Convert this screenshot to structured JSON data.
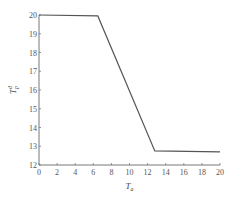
{
  "chart_data": {
    "type": "line",
    "title": "",
    "xlabel": "T_a",
    "ylabel": "T_p^d",
    "xlabel_parts": {
      "main": "T",
      "sub": "a"
    },
    "ylabel_parts": {
      "main": "T",
      "sub": "p",
      "sup": "d"
    },
    "xlim": [
      0,
      20
    ],
    "ylim": [
      12,
      20
    ],
    "xticks": [
      0,
      2,
      4,
      6,
      8,
      10,
      12,
      14,
      16,
      18,
      20
    ],
    "yticks": [
      12,
      13,
      14,
      15,
      16,
      17,
      18,
      19,
      20
    ],
    "grid": false,
    "legend": null,
    "series": [
      {
        "name": "T_p^d",
        "color": "#555555",
        "x": [
          0,
          6.5,
          12.8,
          20
        ],
        "y": [
          20.0,
          19.95,
          12.75,
          12.7
        ]
      }
    ]
  }
}
